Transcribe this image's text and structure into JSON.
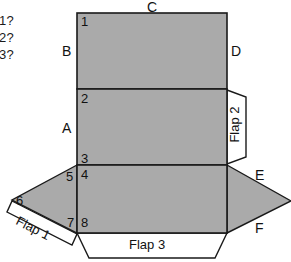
{
  "figure": {
    "title": "",
    "questions": [
      {
        "text": "1?"
      },
      {
        "text": "2?"
      },
      {
        "text": "3?"
      }
    ],
    "edge_labels": [
      {
        "id": "A",
        "text": "A"
      },
      {
        "id": "B",
        "text": "B"
      },
      {
        "id": "C",
        "text": "C"
      },
      {
        "id": "D",
        "text": "D"
      },
      {
        "id": "E",
        "text": "E"
      },
      {
        "id": "F",
        "text": "F"
      }
    ],
    "vertex_labels": [
      {
        "id": "1",
        "text": "1"
      },
      {
        "id": "2",
        "text": "2"
      },
      {
        "id": "3",
        "text": "3"
      },
      {
        "id": "4",
        "text": "4"
      },
      {
        "id": "5",
        "text": "5"
      },
      {
        "id": "6",
        "text": "6"
      },
      {
        "id": "7",
        "text": "7"
      },
      {
        "id": "8",
        "text": "8"
      }
    ],
    "flaps": [
      {
        "id": "flap1",
        "text": "Flap 1"
      },
      {
        "id": "flap2",
        "text": "Flap 2"
      },
      {
        "id": "flap3",
        "text": "Flap 3"
      }
    ],
    "colors": {
      "panel_fill": "#aaaaaa",
      "flap_fill": "#ffffff",
      "stroke": "#1a1a1a",
      "background": "#ffffff",
      "text": "#111111"
    }
  }
}
